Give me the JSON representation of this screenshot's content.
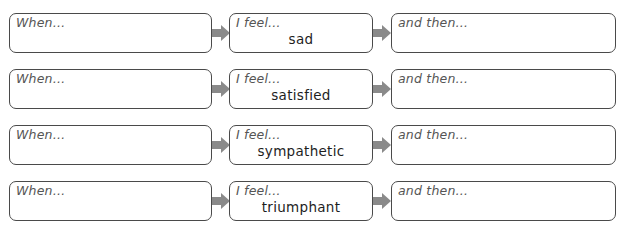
{
  "colors": {
    "box_border": "#4a4a4a",
    "arrow": "#8a8a8a",
    "label_text": "#555555",
    "emotion_text": "#1e1e1e",
    "background": "#ffffff"
  },
  "labels": {
    "when": "When…",
    "feel": "I feel…",
    "then": "and then…"
  },
  "rows": [
    {
      "emotion": "sad"
    },
    {
      "emotion": "satisfied"
    },
    {
      "emotion": "sympathetic"
    },
    {
      "emotion": "triumphant"
    }
  ],
  "icons": {
    "connector": "right-arrow-icon"
  }
}
